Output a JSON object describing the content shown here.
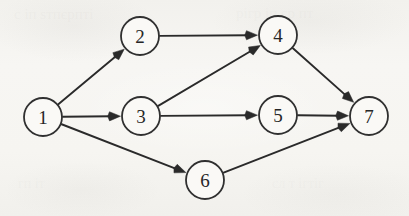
{
  "page": {
    "width": 409,
    "height": 216,
    "background_color": "#f5f4f1",
    "ink_color": "#2a2a2a",
    "node_fill_color": "#faf9f6",
    "node_stroke_color": "#303030"
  },
  "diagram": {
    "type": "directed-graph",
    "node_radius": 19,
    "node_count": 7,
    "edge_count": 9,
    "nodes": [
      {
        "id": "1",
        "label": "1",
        "cx": 43,
        "cy": 117
      },
      {
        "id": "2",
        "label": "2",
        "cx": 140,
        "cy": 36
      },
      {
        "id": "3",
        "label": "3",
        "cx": 141,
        "cy": 116
      },
      {
        "id": "4",
        "label": "4",
        "cx": 278,
        "cy": 35
      },
      {
        "id": "5",
        "label": "5",
        "cx": 278,
        "cy": 115
      },
      {
        "id": "6",
        "label": "6",
        "cx": 205,
        "cy": 180
      },
      {
        "id": "7",
        "label": "7",
        "cx": 369,
        "cy": 116
      }
    ],
    "edges": [
      {
        "from": "1",
        "to": "2",
        "directed": true
      },
      {
        "from": "1",
        "to": "3",
        "directed": true
      },
      {
        "from": "1",
        "to": "6",
        "directed": true
      },
      {
        "from": "2",
        "to": "4",
        "directed": true
      },
      {
        "from": "3",
        "to": "4",
        "directed": true
      },
      {
        "from": "3",
        "to": "5",
        "directed": true
      },
      {
        "from": "4",
        "to": "7",
        "directed": true
      },
      {
        "from": "5",
        "to": "7",
        "directed": true
      },
      {
        "from": "6",
        "to": "7",
        "directed": true
      }
    ]
  },
  "ghost_marks": [
    {
      "text": "с іп ѕтпєрпті",
      "x": 14,
      "y": 6,
      "size": 15,
      "opacity": 0.16
    },
    {
      "text": "рігр іп єр пт",
      "x": 236,
      "y": 5,
      "size": 15,
      "opacity": 0.15
    },
    {
      "text": "гп іт",
      "x": 18,
      "y": 176,
      "size": 14,
      "opacity": 0.14
    },
    {
      "text": "сл т ігтіг",
      "x": 272,
      "y": 176,
      "size": 14,
      "opacity": 0.13
    }
  ]
}
